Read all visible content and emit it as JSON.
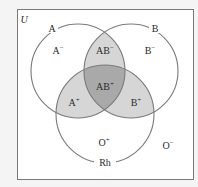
{
  "diagram": {
    "type": "venn",
    "universe_label": "U",
    "sets": [
      {
        "name": "A",
        "label": "A"
      },
      {
        "name": "B",
        "label": "B"
      },
      {
        "name": "Rh",
        "label": "Rh"
      }
    ],
    "regions": {
      "a_neg": {
        "base": "A",
        "sign": "−"
      },
      "b_neg": {
        "base": "B",
        "sign": "−"
      },
      "ab_neg": {
        "base": "AB",
        "sign": "−"
      },
      "ab_pos": {
        "base": "AB",
        "sign": "+"
      },
      "a_pos": {
        "base": "A",
        "sign": "+"
      },
      "b_pos": {
        "base": "B",
        "sign": "+"
      },
      "o_pos": {
        "base": "O",
        "sign": "+"
      },
      "o_neg": {
        "base": "O",
        "sign": "−"
      }
    },
    "colors": {
      "background": "#f4f4f4",
      "universe_fill": "#ffffff",
      "stroke": "#7a7a7a",
      "light_shade": "#d6d6d6",
      "dark_shade": "#a9a9a9",
      "text": "#2a2a2a"
    }
  }
}
